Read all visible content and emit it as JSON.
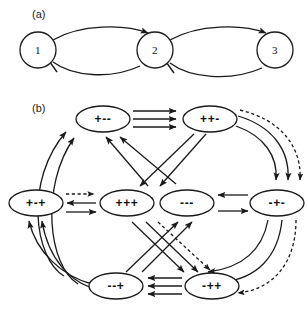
{
  "figure": {
    "panels": [
      {
        "id": "a",
        "label": "(a)",
        "type": "three-node-feedback-chain",
        "nodes": [
          {
            "id": "n1",
            "label": "1",
            "cx": 38,
            "cy": 50,
            "r": 18
          },
          {
            "id": "n2",
            "label": "2",
            "cx": 155,
            "cy": 50,
            "r": 18
          },
          {
            "id": "n3",
            "label": "3",
            "cx": 275,
            "cy": 50,
            "r": 18
          }
        ],
        "edges": [
          {
            "from": "1",
            "to": "2",
            "style": "solid",
            "head": "arrow",
            "side": "top"
          },
          {
            "from": "2",
            "to": "1",
            "style": "solid",
            "head": "bar",
            "side": "bottom"
          },
          {
            "from": "2",
            "to": "3",
            "style": "solid",
            "head": "arrow",
            "side": "top"
          },
          {
            "from": "3",
            "to": "2",
            "style": "solid",
            "head": "bar",
            "side": "bottom"
          }
        ]
      },
      {
        "id": "b",
        "label": "(b)",
        "type": "state-transition-graph",
        "nodes": [
          {
            "id": "pmm",
            "label": "+--",
            "cx": 103,
            "cy": 119,
            "rx": 27,
            "ry": 13
          },
          {
            "id": "ppm",
            "label": "++-",
            "cx": 210,
            "cy": 119,
            "rx": 27,
            "ry": 13
          },
          {
            "id": "pmp",
            "label": "+-+",
            "cx": 36,
            "cy": 203,
            "rx": 27,
            "ry": 13
          },
          {
            "id": "ppp",
            "label": "+++",
            "cx": 127,
            "cy": 203,
            "rx": 27,
            "ry": 13
          },
          {
            "id": "mmm",
            "label": "---",
            "cx": 187,
            "cy": 203,
            "rx": 27,
            "ry": 13
          },
          {
            "id": "mpm",
            "label": "-+-",
            "cx": 277,
            "cy": 203,
            "rx": 27,
            "ry": 13
          },
          {
            "id": "mmp",
            "label": "--+",
            "cx": 116,
            "cy": 286,
            "rx": 27,
            "ry": 13
          },
          {
            "id": "mpp",
            "label": "-++",
            "cx": 212,
            "cy": 286,
            "rx": 27,
            "ry": 13
          }
        ],
        "edges": [
          {
            "from": "+--",
            "to": "++-",
            "style": "solid",
            "head": "arrow",
            "group": "triple-top"
          },
          {
            "from": "+--",
            "to": "++-",
            "style": "solid",
            "head": "arrow",
            "group": "triple-top"
          },
          {
            "from": "+--",
            "to": "++-",
            "style": "solid",
            "head": "arrow",
            "group": "triple-top"
          },
          {
            "from": "-++",
            "to": "--+",
            "style": "solid",
            "head": "arrow",
            "group": "triple-bottom"
          },
          {
            "from": "-++",
            "to": "--+",
            "style": "solid",
            "head": "arrow",
            "group": "triple-bottom"
          },
          {
            "from": "-++",
            "to": "--+",
            "style": "solid",
            "head": "arrow",
            "group": "triple-bottom"
          },
          {
            "from": "+-+",
            "to": "+++",
            "style": "dashed",
            "head": "arrow",
            "group": "left-pair"
          },
          {
            "from": "+++",
            "to": "+-+",
            "style": "solid",
            "head": "arrow",
            "group": "left-pair"
          },
          {
            "from": "+-+",
            "to": "+++",
            "style": "solid",
            "head": "arrow",
            "group": "left-pair"
          },
          {
            "from": "-+-",
            "to": "---",
            "style": "solid",
            "head": "arrow",
            "group": "right-pair"
          },
          {
            "from": "---",
            "to": "-+-",
            "style": "solid",
            "head": "arrow",
            "group": "right-pair"
          },
          {
            "from": "--+",
            "to": "+--",
            "style": "solid",
            "head": "arrow",
            "group": "left-outer-curve"
          },
          {
            "from": "--+",
            "to": "+--",
            "style": "solid",
            "head": "arrow",
            "group": "left-outer-curve"
          },
          {
            "from": "++-",
            "to": "-+-",
            "style": "solid",
            "head": "arrow",
            "group": "right-outer-curve"
          },
          {
            "from": "++-",
            "to": "-+-",
            "style": "solid",
            "head": "arrow",
            "group": "right-outer-curve"
          },
          {
            "from": "++-",
            "to": "-+-",
            "style": "dashed",
            "head": "arrow",
            "group": "right-outer-curve"
          },
          {
            "from": "-+-",
            "to": "-++",
            "style": "solid",
            "head": "arrow",
            "group": "right-lower-curve"
          },
          {
            "from": "-+-",
            "to": "-++",
            "style": "solid",
            "head": "arrow",
            "group": "right-lower-curve"
          },
          {
            "from": "-+-",
            "to": "-++",
            "style": "dashed",
            "head": "arrow",
            "group": "right-lower-curve"
          },
          {
            "from": "+++",
            "to": "+--",
            "style": "solid",
            "head": "arrow",
            "group": "upper-cross"
          },
          {
            "from": "---",
            "to": "+--",
            "style": "solid",
            "head": "arrow",
            "group": "upper-cross"
          },
          {
            "from": "++-",
            "to": "+++",
            "style": "solid",
            "head": "arrow",
            "group": "upper-cross"
          },
          {
            "from": "++-",
            "to": "---",
            "style": "solid",
            "head": "arrow",
            "group": "upper-cross"
          },
          {
            "from": "--+",
            "to": "---",
            "style": "solid",
            "head": "arrow",
            "group": "lower-cross"
          },
          {
            "from": "--+",
            "to": "-+-",
            "style": "solid",
            "head": "arrow",
            "group": "lower-cross"
          },
          {
            "from": "+++",
            "to": "-++",
            "style": "solid",
            "head": "arrow",
            "group": "lower-cross"
          },
          {
            "from": "+++",
            "to": "-++",
            "style": "dashed",
            "head": "arrow",
            "group": "lower-cross"
          }
        ]
      }
    ]
  }
}
